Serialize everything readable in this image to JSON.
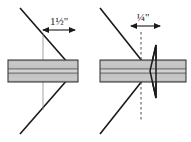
{
  "figure": {
    "type": "technical-drawing",
    "colors": {
      "outline": "#1a1a1a",
      "shaft_band_light": "#c8c8c8",
      "shaft_band_mid": "#b4b4b4",
      "shaft_core_dark": "#707070",
      "shaft_outline": "#3c3c3c",
      "leader_line": "#808080",
      "dashed_line": "#4a4a4a",
      "background": "#ffffff"
    },
    "views": [
      {
        "id": "left-view",
        "name": "cone-full-engagement-view",
        "dimension": {
          "label": "1½\"",
          "value": 1.5,
          "unit": "inch",
          "arrow_style": "double-headed",
          "measures": "distance from cone reference plane to cone apex"
        },
        "elements": [
          "cone-outline",
          "horizontal-shaft",
          "vertical-leader-line",
          "dimension-arrow"
        ]
      },
      {
        "id": "right-view",
        "name": "cone-partial-engagement-view",
        "dimension": {
          "label": "¼\"",
          "value": 0.25,
          "unit": "inch",
          "arrow_style": "double-headed-outward",
          "measures": "gap between dashed reference plane and wedge back face"
        },
        "elements": [
          "cone-outline",
          "dashed-reference-line",
          "wedge-triangle",
          "horizontal-shaft",
          "dimension-arrow"
        ]
      }
    ]
  },
  "geometry": {
    "left_view": {
      "cone_apex_x": 75,
      "cone_apex_y": 71,
      "cone_top_x": 20,
      "cone_top_y": 8,
      "cone_bottom_x": 20,
      "cone_bottom_y": 134,
      "shaft_left_x": 8,
      "shaft_right_x": 78,
      "shaft_center_y": 71,
      "shaft_half_height": 11,
      "leader_x": 43,
      "dim_y": 30,
      "dim_left_x": 43,
      "dim_right_x": 75,
      "label_x": 59,
      "label_y": 24
    },
    "right_view": {
      "cone_apex_x": 150,
      "cone_apex_y": 71,
      "cone_top_x": 100,
      "cone_top_y": 8,
      "cone_bottom_x": 100,
      "cone_bottom_y": 134,
      "dashed_x": 141,
      "wedge_back_x": 156,
      "wedge_apex_x": 150,
      "wedge_top_y": 45,
      "wedge_bottom_y": 98,
      "shaft_left_x": 100,
      "shaft_right_x": 186,
      "shaft_center_y": 71,
      "shaft_half_height": 11,
      "dim_y": 26,
      "dim_left_x": 141,
      "dim_right_x": 150,
      "label_x": 143,
      "label_y": 20
    }
  }
}
